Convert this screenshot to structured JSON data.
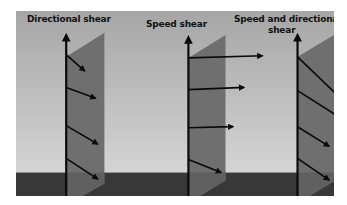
{
  "diagram": {
    "colors": {
      "sky_top": "#a6a6a6",
      "sky_bottom": "#d2d2d2",
      "ground": "#383838",
      "panel": "#6f6f6f",
      "panel_ground": "#5e5e5e",
      "arrow": "#0a0a0a"
    },
    "panels": [
      {
        "title": "Directional shear",
        "description": "Wind direction changes with height, speed constant"
      },
      {
        "title": "Speed shear",
        "description": "Wind speed increases with height, direction constant"
      },
      {
        "title_line1": "Speed  and directional",
        "title_line2": "shear",
        "description": "Both wind speed and direction change with height"
      }
    ]
  }
}
